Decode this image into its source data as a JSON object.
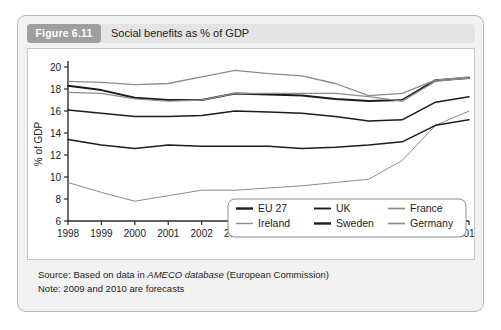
{
  "figure": {
    "tag": "Figure 6.11",
    "title": "Social benefits as % of GDP"
  },
  "footer": {
    "source_prefix": "Source: Based on data in ",
    "source_italic": "AMECO database",
    "source_suffix": " (European Commission)",
    "note": "Note: 2009 and 2010 are forecasts"
  },
  "colors": {
    "card_background": "#f2f2f2",
    "header_background": "#e4e4e4",
    "tag_background": "#9f9f9f",
    "panel_background": "#ffffff",
    "dark_series": "#1c1c1c",
    "light_series": "#8c8c8c",
    "axis": "#2b2b2b"
  },
  "chart_data": {
    "type": "line",
    "title": "Social benefits as % of GDP",
    "xlabel": "",
    "ylabel": "% of GDP",
    "x": [
      1998,
      1999,
      2000,
      2001,
      2002,
      2003,
      2004,
      2005,
      2006,
      2007,
      2008,
      2009,
      2010
    ],
    "xlim": [
      1998,
      2010
    ],
    "ylim": [
      6,
      20
    ],
    "yticks": [
      6,
      8,
      10,
      12,
      14,
      16,
      18,
      20
    ],
    "xticks": [
      "1998",
      "1999",
      "2000",
      "2001",
      "2002",
      "2003",
      "2004",
      "2005",
      "2006",
      "2007",
      "2008",
      "2009",
      "2010"
    ],
    "grid": false,
    "legend_position": "bottom-right",
    "series": [
      {
        "name": "EU 27",
        "style": "dark-thick",
        "values": [
          18.3,
          17.9,
          17.2,
          17.0,
          17.0,
          17.6,
          17.5,
          17.4,
          17.1,
          16.9,
          17.0,
          18.8,
          19.0
        ]
      },
      {
        "name": "UK",
        "style": "dark-medium",
        "values": [
          16.1,
          15.8,
          15.5,
          15.5,
          15.6,
          16.0,
          15.9,
          15.8,
          15.5,
          15.1,
          15.2,
          16.8,
          17.3
        ]
      },
      {
        "name": "France",
        "style": "light-medium",
        "values": [
          18.7,
          18.6,
          18.4,
          18.5,
          19.1,
          19.7,
          19.4,
          19.2,
          18.5,
          17.4,
          17.6,
          18.8,
          19.1
        ]
      },
      {
        "name": "Ireland",
        "style": "light-thin",
        "values": [
          9.5,
          8.6,
          7.8,
          8.3,
          8.8,
          8.8,
          9.0,
          9.2,
          9.5,
          9.8,
          11.5,
          14.7,
          16.0
        ]
      },
      {
        "name": "Sweden",
        "style": "dark-medium",
        "values": [
          13.4,
          12.9,
          12.6,
          12.9,
          12.8,
          12.8,
          12.8,
          12.6,
          12.7,
          12.9,
          13.2,
          14.7,
          15.2
        ]
      },
      {
        "name": "Germany",
        "style": "light-medium",
        "values": [
          17.7,
          17.6,
          17.1,
          16.9,
          17.0,
          17.6,
          17.6,
          17.6,
          17.6,
          17.3,
          16.9,
          18.7,
          19.0
        ]
      }
    ],
    "legend_entries": [
      {
        "label": "EU 27",
        "style": "dark-thick"
      },
      {
        "label": "UK",
        "style": "dark-medium"
      },
      {
        "label": "France",
        "style": "light-medium"
      },
      {
        "label": "Ireland",
        "style": "light-thin"
      },
      {
        "label": "Sweden",
        "style": "dark-thick"
      },
      {
        "label": "Germany",
        "style": "light-medium"
      }
    ]
  }
}
